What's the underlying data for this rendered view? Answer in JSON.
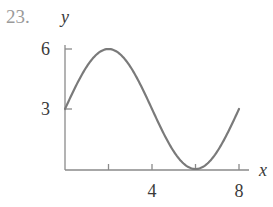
{
  "problem": {
    "number": "23."
  },
  "chart_data": {
    "type": "line",
    "title": "",
    "xlabel": "x",
    "ylabel": "y",
    "x_ticks": [
      0,
      2,
      4,
      6,
      8
    ],
    "x_tick_labels": [
      {
        "value": 4,
        "label": "4"
      },
      {
        "value": 8,
        "label": "8"
      }
    ],
    "y_ticks": [
      3,
      6
    ],
    "y_tick_labels": [
      {
        "value": 3,
        "label": "3"
      },
      {
        "value": 6,
        "label": "6"
      }
    ],
    "xlim": [
      0,
      8
    ],
    "ylim": [
      0,
      6
    ],
    "grid": false,
    "legend": null,
    "function_description": "y = 3 + 3 sin(pi x / 4)",
    "series": [
      {
        "name": "curve",
        "x": [
          0,
          1,
          2,
          3,
          4,
          5,
          6,
          7,
          8
        ],
        "y": [
          3,
          5.12,
          6,
          5.12,
          3,
          0.88,
          0,
          0.88,
          3
        ]
      }
    ],
    "colors": {
      "curve": "#7a7a7a",
      "axis": "#8a8a8a"
    }
  }
}
